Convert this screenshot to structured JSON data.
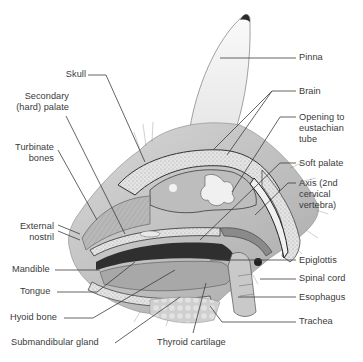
{
  "figure": {
    "labels_left": [
      {
        "id": "skull",
        "text": "Skull"
      },
      {
        "id": "secondary-hard-palate",
        "text": "Secondary\n(hard) palate"
      },
      {
        "id": "turbinate-bones",
        "text": "Turbinate\nbones"
      },
      {
        "id": "external-nostril",
        "text": "External\nnostril"
      },
      {
        "id": "mandible",
        "text": "Mandible"
      },
      {
        "id": "tongue",
        "text": "Tongue"
      },
      {
        "id": "hyoid-bone",
        "text": "Hyoid bone"
      },
      {
        "id": "submandibular-gland",
        "text": "Submandibular gland"
      }
    ],
    "labels_right": [
      {
        "id": "pinna",
        "text": "Pinna"
      },
      {
        "id": "brain",
        "text": "Brain"
      },
      {
        "id": "opening-to-eustachian-tube",
        "text": "Opening to\neustachian\ntube"
      },
      {
        "id": "soft-palate",
        "text": "Soft palate"
      },
      {
        "id": "axis",
        "text": "Axis (2nd\ncervical\nvertebra)"
      },
      {
        "id": "epiglottis",
        "text": "Epiglottis"
      },
      {
        "id": "spinal-cord",
        "text": "Spinal cord"
      },
      {
        "id": "esophagus",
        "text": "Esophagus"
      },
      {
        "id": "trachea",
        "text": "Trachea"
      }
    ],
    "labels_bottom": [
      {
        "id": "thyroid-cartilage",
        "text": "Thyroid cartilage"
      }
    ]
  }
}
